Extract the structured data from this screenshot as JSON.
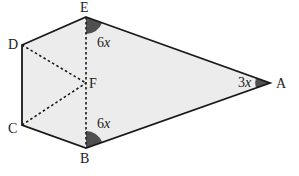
{
  "diagram": {
    "type": "geometry-figure",
    "fill_color": "#ececec",
    "line_color": "#1a1a1a",
    "angle_fill_color": "#505050",
    "points": {
      "A": {
        "label": "A"
      },
      "B": {
        "label": "B"
      },
      "C": {
        "label": "C"
      },
      "D": {
        "label": "D"
      },
      "E": {
        "label": "E"
      },
      "F": {
        "label": "F"
      }
    },
    "angles": {
      "E": {
        "coef": "6",
        "var": "x"
      },
      "B": {
        "coef": "6",
        "var": "x"
      },
      "A": {
        "coef": "3",
        "var": "x"
      }
    },
    "solid_edges": [
      "AE",
      "ED",
      "DC",
      "CB",
      "BA"
    ],
    "dashed_edges": [
      "EB",
      "DF",
      "CF"
    ]
  }
}
